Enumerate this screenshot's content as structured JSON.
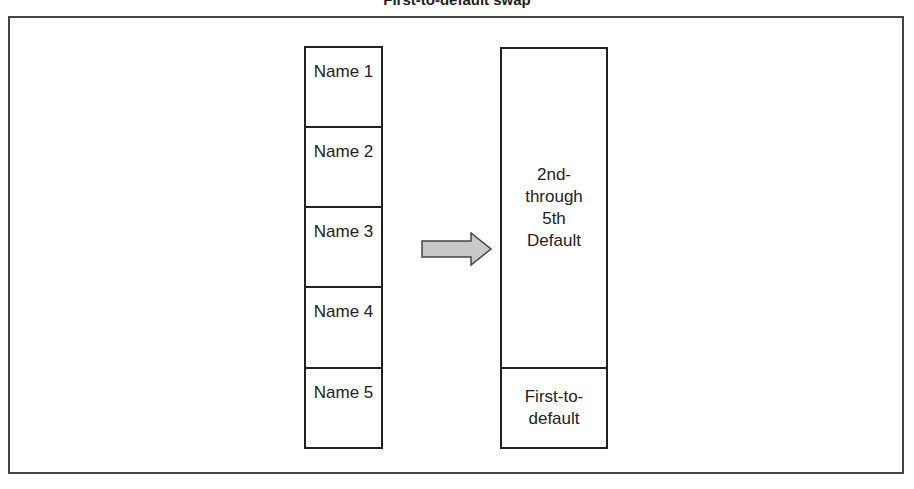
{
  "title": "First-to-default swap",
  "left_column": {
    "cells": [
      {
        "label": "Name 1"
      },
      {
        "label": "Name 2"
      },
      {
        "label": "Name 3"
      },
      {
        "label": "Name 4"
      },
      {
        "label": "Name 5"
      }
    ]
  },
  "arrow": {
    "icon": "right-arrow-icon",
    "fill": "#c8c8c8",
    "stroke": "#444444"
  },
  "right_column": {
    "top_label_lines": [
      "2nd-",
      "through",
      "5th",
      "Default"
    ],
    "bottom_label_lines": [
      "First-to-",
      "default"
    ]
  }
}
